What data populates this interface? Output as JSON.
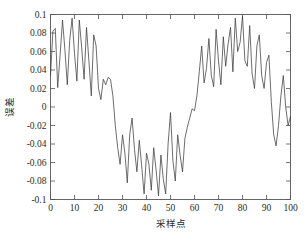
{
  "chart_data": {
    "type": "line",
    "title": "",
    "xlabel": "采样点",
    "ylabel": "误差",
    "xlim": [
      0,
      100
    ],
    "ylim": [
      -0.1,
      0.1
    ],
    "grid": false,
    "legend": null,
    "line_color": "#3c3c3c",
    "frame_color": "#555555",
    "background_color": "#ffffff",
    "xticks": [
      0,
      10,
      20,
      30,
      40,
      50,
      60,
      70,
      80,
      90,
      100
    ],
    "xtick_labels": [
      "0",
      "10",
      "20",
      "30",
      "40",
      "50",
      "60",
      "70",
      "80",
      "90",
      "100"
    ],
    "yticks": [
      -0.1,
      -0.08,
      -0.06,
      -0.04,
      -0.02,
      0,
      0.02,
      0.04,
      0.06,
      0.08,
      0.1
    ],
    "ytick_labels": [
      "-0.1",
      "-0.08",
      "-0.06",
      "-0.04",
      "-0.02",
      "0",
      "0.02",
      "0.04",
      "0.06",
      "0.08",
      "0.1"
    ],
    "series": [
      {
        "name": "error",
        "x": [
          0,
          1,
          2,
          3,
          4,
          5,
          6,
          7,
          8,
          9,
          10,
          11,
          12,
          13,
          14,
          15,
          16,
          17,
          18,
          19,
          20,
          21,
          22,
          23,
          24,
          25,
          26,
          27,
          28,
          29,
          30,
          31,
          32,
          33,
          34,
          35,
          36,
          37,
          38,
          39,
          40,
          41,
          42,
          43,
          44,
          45,
          46,
          47,
          48,
          49,
          50,
          51,
          52,
          53,
          54,
          55,
          56,
          57,
          58,
          59,
          60,
          61,
          62,
          63,
          64,
          65,
          66,
          67,
          68,
          69,
          70,
          71,
          72,
          73,
          74,
          75,
          76,
          77,
          78,
          79,
          80,
          81,
          82,
          83,
          84,
          85,
          86,
          87,
          88,
          89,
          90,
          91,
          92,
          93,
          94,
          95,
          96,
          97,
          98,
          99,
          100
        ],
        "values": [
          0.034,
          0.082,
          0.085,
          0.021,
          0.056,
          0.094,
          0.062,
          0.024,
          0.072,
          0.096,
          0.058,
          0.028,
          0.094,
          0.064,
          0.03,
          0.086,
          0.05,
          0.012,
          0.078,
          0.066,
          0.02,
          0.008,
          0.03,
          0.024,
          0.032,
          0.03,
          0.012,
          -0.02,
          -0.044,
          -0.062,
          -0.03,
          -0.05,
          -0.082,
          -0.03,
          -0.012,
          -0.046,
          -0.07,
          -0.036,
          -0.064,
          -0.094,
          -0.05,
          -0.062,
          -0.09,
          -0.044,
          -0.068,
          -0.096,
          -0.052,
          -0.078,
          -0.094,
          -0.04,
          -0.006,
          -0.058,
          -0.08,
          -0.03,
          -0.052,
          -0.07,
          -0.034,
          -0.022,
          -0.012,
          -0.002,
          -0.004,
          0.012,
          0.038,
          0.066,
          0.026,
          0.042,
          0.074,
          0.034,
          0.022,
          0.084,
          0.05,
          0.024,
          0.076,
          0.044,
          0.068,
          0.086,
          0.038,
          0.096,
          0.06,
          0.07,
          0.098,
          0.05,
          0.044,
          0.088,
          0.036,
          0.02,
          0.066,
          0.078,
          0.034,
          0.02,
          0.048,
          0.056,
          0.006,
          -0.03,
          -0.042,
          -0.02,
          0.012,
          0.034,
          0.0,
          -0.02,
          -0.01
        ]
      }
    ]
  }
}
